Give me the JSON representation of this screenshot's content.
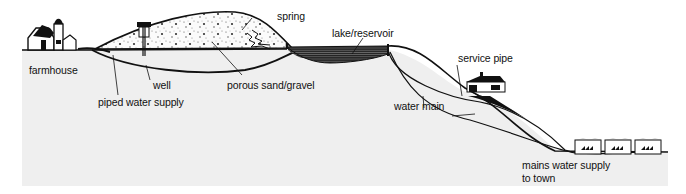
{
  "diagram": {
    "type": "cross-section",
    "labels": {
      "farmhouse": "farmhouse",
      "well": "well",
      "piped_water_supply": "piped water supply",
      "porous_sand_gravel": "porous sand/gravel",
      "spring": "spring",
      "lake_reservoir": "lake/reservoir",
      "service_pipe": "service pipe",
      "water_main": "water main",
      "mains_line1": "mains water supply",
      "mains_line2": "to town"
    },
    "colors": {
      "ground": "#efefef",
      "ink": "#111111",
      "background": "#ffffff"
    }
  }
}
